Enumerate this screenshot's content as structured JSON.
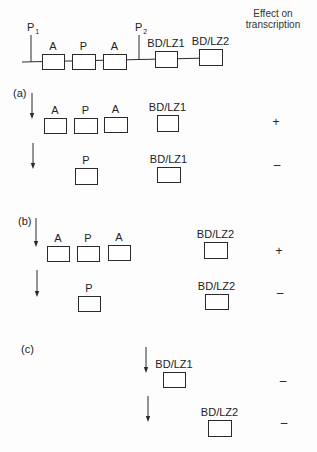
{
  "header": {
    "effect_line1": "Effect on",
    "effect_line2": "transcription"
  },
  "construct": {
    "promoters": [
      {
        "id": "P1",
        "main": "P",
        "sub": "1",
        "x": 31,
        "label_x": 27,
        "label_y": 22
      },
      {
        "id": "P2",
        "main": "P",
        "sub": "2",
        "x": 139,
        "label_x": 135,
        "label_y": 22
      }
    ],
    "line": {
      "x1": 22,
      "y1": 62,
      "x2": 210,
      "y2": 58
    },
    "elements": [
      {
        "label": "A",
        "x": 42,
        "y": 54,
        "w": 22,
        "h": 15
      },
      {
        "label": "P",
        "x": 72,
        "y": 54,
        "w": 23,
        "h": 15
      },
      {
        "label": "A",
        "x": 103,
        "y": 54,
        "w": 23,
        "h": 15
      },
      {
        "label": "BD/LZ1",
        "x": 155,
        "y": 51,
        "w": 22,
        "h": 16
      },
      {
        "label": "BD/LZ2",
        "x": 199,
        "y": 49,
        "w": 23,
        "h": 16
      }
    ]
  },
  "panels": [
    {
      "label": "(a)",
      "label_x": 13,
      "label_y": 88,
      "rows": [
        {
          "arrow": {
            "x": 32,
            "y1": 93,
            "y2": 119
          },
          "elements": [
            {
              "label": "A",
              "x": 44,
              "y": 118,
              "w": 22,
              "h": 15
            },
            {
              "label": "P",
              "x": 74,
              "y": 118,
              "w": 23,
              "h": 15
            },
            {
              "label": "A",
              "x": 104,
              "y": 117,
              "w": 23,
              "h": 15
            },
            {
              "label": "BD/LZ1",
              "x": 157,
              "y": 115,
              "w": 21,
              "h": 16
            }
          ],
          "effect": "+",
          "effect_x": 276,
          "effect_y": 117
        },
        {
          "arrow": {
            "x": 33,
            "y1": 143,
            "y2": 169
          },
          "elements": [
            {
              "label": "P",
              "x": 75,
              "y": 168,
              "w": 22,
              "h": 16
            },
            {
              "label": "BD/LZ1",
              "x": 157,
              "y": 167,
              "w": 23,
              "h": 15
            }
          ],
          "effect": "–",
          "effect_x": 277,
          "effect_y": 160
        }
      ]
    },
    {
      "label": "(b)",
      "label_x": 18,
      "label_y": 216,
      "rows": [
        {
          "arrow": {
            "x": 36,
            "y1": 218,
            "y2": 247
          },
          "elements": [
            {
              "label": "A",
              "x": 47,
              "y": 246,
              "w": 22,
              "h": 15
            },
            {
              "label": "P",
              "x": 77,
              "y": 246,
              "w": 22,
              "h": 15
            },
            {
              "label": "A",
              "x": 108,
              "y": 245,
              "w": 22,
              "h": 15
            },
            {
              "label": "BD/LZ2",
              "x": 204,
              "y": 242,
              "w": 23,
              "h": 16
            }
          ],
          "effect": "+",
          "effect_x": 279,
          "effect_y": 246
        },
        {
          "arrow": {
            "x": 37,
            "y1": 270,
            "y2": 297
          },
          "elements": [
            {
              "label": "P",
              "x": 78,
              "y": 296,
              "w": 22,
              "h": 15
            },
            {
              "label": "BD/LZ2",
              "x": 205,
              "y": 294,
              "w": 23,
              "h": 15
            }
          ],
          "effect": "–",
          "effect_x": 280,
          "effect_y": 288
        }
      ]
    },
    {
      "label": "(c)",
      "label_x": 21,
      "label_y": 344,
      "rows": [
        {
          "arrow": {
            "x": 146,
            "y1": 347,
            "y2": 373
          },
          "elements": [
            {
              "label": "BD/LZ1",
              "x": 163,
              "y": 372,
              "w": 22,
              "h": 15
            }
          ],
          "effect": "–",
          "effect_x": 283,
          "effect_y": 376
        },
        {
          "arrow": {
            "x": 148,
            "y1": 396,
            "y2": 422
          },
          "elements": [
            {
              "label": "BD/LZ2",
              "x": 208,
              "y": 420,
              "w": 23,
              "h": 16
            }
          ],
          "effect": "–",
          "effect_x": 284,
          "effect_y": 418
        }
      ]
    }
  ],
  "colors": {
    "ink": "#2a2a2a",
    "background": "#fdfdfd"
  }
}
